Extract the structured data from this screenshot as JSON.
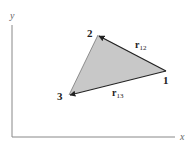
{
  "axes": {
    "x_label": "x",
    "y_label": "y"
  },
  "points": [
    {
      "label": "1",
      "x": 166,
      "y": 71
    },
    {
      "label": "2",
      "x": 98,
      "y": 35
    },
    {
      "label": "3",
      "x": 69,
      "y": 95
    }
  ],
  "vectors": [
    {
      "name": "r",
      "subscript": "12",
      "from": "1",
      "to": "2"
    },
    {
      "name": "r",
      "subscript": "13",
      "from": "1",
      "to": "3"
    }
  ],
  "colors": {
    "fill": "#c8c8c8",
    "stroke": "#222222",
    "axis": "#888888"
  }
}
